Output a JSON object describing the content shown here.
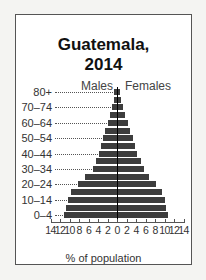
{
  "card": {
    "title_line1": "Guatemala,",
    "title_line2": "2014"
  },
  "chart_data": {
    "type": "bar",
    "orientation": "horizontal",
    "subtype": "population-pyramid",
    "title": "Guatemala, 2014",
    "xlabel": "% of population",
    "ylabel": "",
    "categories": [
      "80+",
      "75–79",
      "70–74",
      "65–69",
      "60–64",
      "55–59",
      "50–54",
      "45–49",
      "40–44",
      "35–39",
      "30–34",
      "25–29",
      "20–24",
      "15–19",
      "10–14",
      "5–9",
      "0–4"
    ],
    "visible_category_labels": [
      "80+",
      "70–74",
      "60–64",
      "50–54",
      "40–44",
      "30–34",
      "20–24",
      "10–14",
      "0–4"
    ],
    "series": [
      {
        "name": "Males",
        "side": "left",
        "values": [
          0.6,
          0.7,
          1.0,
          1.5,
          2.0,
          2.5,
          3.0,
          3.3,
          3.8,
          4.5,
          5.1,
          6.7,
          8.2,
          9.6,
          10.3,
          10.8,
          11.1
        ]
      },
      {
        "name": "Females",
        "side": "right",
        "values": [
          0.7,
          0.8,
          1.2,
          1.7,
          2.3,
          2.8,
          3.4,
          3.7,
          4.3,
          5.0,
          5.7,
          6.8,
          8.2,
          9.4,
          10.0,
          10.4,
          10.7
        ]
      }
    ],
    "x_ticks": [
      "14",
      "12",
      "10",
      "8",
      "6",
      "4",
      "2",
      "0",
      "2",
      "4",
      "6",
      "8",
      "10",
      "12",
      "14"
    ],
    "xlim": [
      -14,
      14
    ],
    "legend": [
      "Males",
      "Females"
    ],
    "legend_position": "top",
    "grid": false,
    "colors": {
      "bar": "#3d3d3d",
      "center_line": "#000000"
    }
  }
}
